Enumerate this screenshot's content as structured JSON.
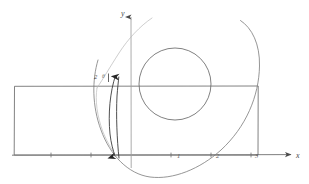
{
  "figure": {
    "kind": "hand-drawn-cartesian-sketch",
    "width": 309,
    "height": 184,
    "background_color": "#ffffff",
    "ink_color": "#555555",
    "light_ink_color": "#9a9a9a",
    "dark_ink_color": "#2e2e2e"
  },
  "axes": {
    "x_axis_label": "x",
    "y_axis_label": "y",
    "x_axis_y_pixel": 155,
    "y_axis_x_pixel": 131,
    "x_axis_from_pixel": 12,
    "x_axis_to_pixel": 294,
    "y_axis_from_pixel": 16,
    "y_axis_to_pixel": 168,
    "unit_pixels": 40,
    "x_ticks": [
      {
        "label": "1",
        "value": 1,
        "x_pixel": 171
      },
      {
        "label": "2",
        "value": 2,
        "x_pixel": 211
      },
      {
        "label": "3",
        "value": 3,
        "x_pixel": 251
      }
    ],
    "minor_tick_pixels": [
      51,
      91,
      131,
      171,
      211,
      251
    ]
  },
  "annotations": {
    "left_label_main": "2",
    "left_label_sub": "θ"
  },
  "shapes": {
    "rectangle": {
      "name": "rectangle",
      "left_pixel": 14,
      "top_pixel": 86,
      "right_pixel": 258,
      "bottom_pixel": 155
    },
    "small_circle": {
      "name": "small-circle",
      "center_x_pixel": 175,
      "center_y_pixel": 84,
      "radius_pixel": 36
    },
    "large_arc": {
      "name": "large-arc",
      "center_x_pixel": 131,
      "center_y_pixel": 84,
      "radius_pixel": 93,
      "start_angle_deg": -70,
      "end_angle_deg": 200
    },
    "light_arc": {
      "name": "light-arc-upper-left",
      "description": "faint thin arc sweeping from upper right down to the left"
    },
    "arrow_curve": {
      "name": "arrowed-curve",
      "description": "narrow lens-shaped curve with arrowheads at top and bottom near x = -0.8"
    }
  }
}
